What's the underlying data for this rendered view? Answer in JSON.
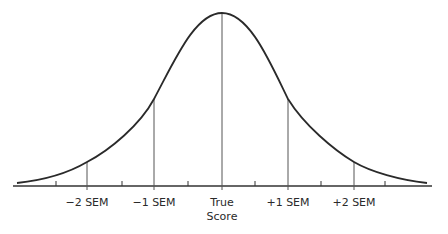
{
  "diagram": {
    "type": "normal-distribution-curve",
    "curve_color": "#2a2a2a",
    "line_color": "#555555",
    "labels": [
      {
        "id": "minus-2-sem",
        "text": "−2 SEM",
        "x": 87
      },
      {
        "id": "minus-1-sem",
        "text": "−1 SEM",
        "x": 154
      },
      {
        "id": "true-score",
        "text": "True",
        "text2": "Score",
        "x": 222
      },
      {
        "id": "plus-1-sem",
        "text": "+1 SEM",
        "x": 288
      },
      {
        "id": "plus-2-sem",
        "text": "+2 SEM",
        "x": 354
      }
    ]
  }
}
